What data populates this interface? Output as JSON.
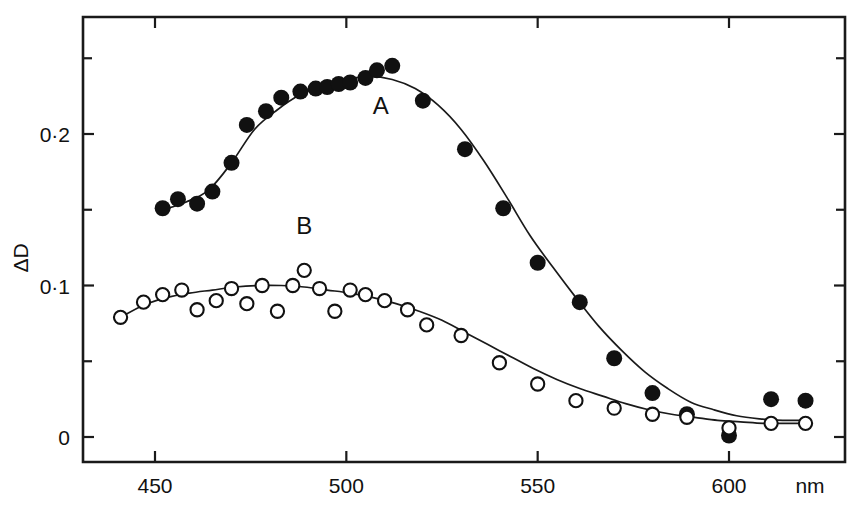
{
  "figure": {
    "background": "#ffffff",
    "ink_color": "#111111"
  },
  "chart_data": {
    "type": "scatter",
    "title": "",
    "subtitle": "",
    "xlabel": "nm",
    "ylabel": "ΔD",
    "xlim": [
      437,
      622
    ],
    "ylim": [
      -0.008,
      0.262
    ],
    "grid": false,
    "legend_position": "inline-annotations",
    "x_ticks_major": [
      450,
      500,
      550,
      600
    ],
    "x_tick_labels": [
      "450",
      "500",
      "550",
      "600"
    ],
    "y_ticks_major": [
      0,
      0.1,
      0.2
    ],
    "y_tick_labels": [
      "0",
      "0·1",
      "0·2"
    ],
    "y_ticks_minor": [
      0.05,
      0.15,
      0.25
    ],
    "annotations": [
      {
        "text": "A",
        "x": 509,
        "y": 0.213
      },
      {
        "text": "B",
        "x": 489,
        "y": 0.134
      }
    ],
    "series": [
      {
        "name": "A",
        "marker": "filled-circle",
        "marker_color": "#111111",
        "x": [
          452,
          456,
          461,
          465,
          470,
          474,
          479,
          483,
          488,
          492,
          495,
          498,
          501,
          505,
          508,
          512,
          520,
          531,
          541,
          550,
          561,
          570,
          580,
          589,
          600,
          611,
          620
        ],
        "y": [
          0.151,
          0.157,
          0.154,
          0.162,
          0.181,
          0.206,
          0.215,
          0.224,
          0.228,
          0.23,
          0.231,
          0.233,
          0.234,
          0.237,
          0.242,
          0.245,
          0.222,
          0.19,
          0.151,
          0.115,
          0.089,
          0.052,
          0.029,
          0.015,
          0.001,
          0.025,
          0.024
        ]
      },
      {
        "name": "B",
        "marker": "open-circle",
        "marker_color": "#111111",
        "x": [
          441,
          447,
          452,
          457,
          461,
          466,
          470,
          474,
          478,
          482,
          486,
          489,
          493,
          497,
          501,
          505,
          510,
          516,
          521,
          530,
          540,
          550,
          560,
          570,
          580,
          589,
          600,
          611,
          620
        ],
        "y": [
          0.079,
          0.089,
          0.094,
          0.097,
          0.084,
          0.09,
          0.098,
          0.088,
          0.1,
          0.083,
          0.1,
          0.11,
          0.098,
          0.083,
          0.097,
          0.094,
          0.09,
          0.084,
          0.074,
          0.067,
          0.049,
          0.035,
          0.024,
          0.019,
          0.015,
          0.013,
          0.006,
          0.009,
          0.009
        ]
      }
    ],
    "fitted_curves": [
      {
        "name": "A-fit",
        "x": [
          452,
          458,
          464,
          470,
          476,
          482,
          488,
          494,
          500,
          506,
          512,
          518,
          524,
          530,
          536,
          542,
          548,
          554,
          560,
          566,
          572,
          578,
          584,
          590,
          596,
          602,
          608,
          614,
          620
        ],
        "y": [
          0.15,
          0.155,
          0.163,
          0.181,
          0.203,
          0.216,
          0.226,
          0.232,
          0.236,
          0.238,
          0.236,
          0.23,
          0.219,
          0.203,
          0.182,
          0.158,
          0.133,
          0.112,
          0.092,
          0.073,
          0.057,
          0.043,
          0.032,
          0.023,
          0.018,
          0.014,
          0.012,
          0.011,
          0.011
        ]
      },
      {
        "name": "B-fit",
        "x": [
          441,
          447,
          453,
          459,
          465,
          471,
          477,
          483,
          489,
          495,
          501,
          507,
          513,
          519,
          525,
          531,
          537,
          543,
          549,
          555,
          561,
          567,
          573,
          579,
          585,
          591,
          597,
          603,
          609,
          615,
          620
        ],
        "y": [
          0.079,
          0.087,
          0.092,
          0.095,
          0.097,
          0.099,
          0.1,
          0.1,
          0.099,
          0.097,
          0.095,
          0.092,
          0.088,
          0.083,
          0.077,
          0.069,
          0.061,
          0.053,
          0.045,
          0.038,
          0.032,
          0.027,
          0.022,
          0.018,
          0.015,
          0.013,
          0.011,
          0.01,
          0.009,
          0.009,
          0.009
        ]
      }
    ]
  }
}
